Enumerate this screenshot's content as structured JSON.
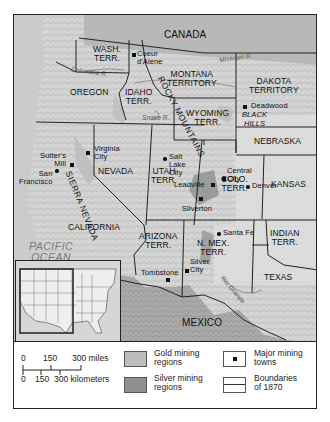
{
  "map": {
    "regions": {
      "canada": "CANADA",
      "wash": "WASH.\nTERR.",
      "oregon": "OREGON",
      "idaho": "IDAHO\nTERR.",
      "montana": "MONTANA\nTERRITORY",
      "dakota": "DAKOTA\nTERRITORY",
      "wyoming": "WYOMING\nTERR.",
      "nebraska": "NEBRASKA",
      "nevada": "NEVADA",
      "utah": "UTAH\nTERR.",
      "colorado": "COLO.\nTERR.",
      "kansas": "KANSAS",
      "california": "CALIFORNIA",
      "arizona": "ARIZONA\nTERR.",
      "new_mexico": "N. MEX.\nTERR.",
      "indian": "INDIAN\nTERR.",
      "texas": "TEXAS",
      "mexico": "MEXICO",
      "pacific": "PACIFIC\nOCEAN"
    },
    "features": {
      "sierra_nevada": "SIERRA NEVADA",
      "rocky_mountains": "ROCKY MOUNTAINS",
      "black_hills": "BLACK\nHILLS",
      "missouri_river": "Missouri R.",
      "columbia_river": "Columbia R.",
      "snake_river": "Snake R.",
      "rio_grande": "Rio Grande"
    },
    "towns": [
      {
        "name": "Coeur\nd'Alene",
        "type": "mining"
      },
      {
        "name": "Deadwood",
        "type": "mining"
      },
      {
        "name": "Virginia\nCity",
        "type": "mining"
      },
      {
        "name": "Sutter's\nMill",
        "type": "mining"
      },
      {
        "name": "San\nFrancisco",
        "type": "city"
      },
      {
        "name": "Salt\nLake\nCity",
        "type": "city"
      },
      {
        "name": "Central\nCity",
        "type": "mining"
      },
      {
        "name": "Leadville",
        "type": "mining"
      },
      {
        "name": "Denver",
        "type": "city"
      },
      {
        "name": "Silverton",
        "type": "mining"
      },
      {
        "name": "Santa Fe",
        "type": "city"
      },
      {
        "name": "Silver\nCity",
        "type": "mining"
      },
      {
        "name": "Tombstone",
        "type": "mining"
      }
    ]
  },
  "legend": {
    "scale_miles": [
      "0",
      "150",
      "300 miles"
    ],
    "scale_km": [
      "0",
      "150",
      "300 kilometers"
    ],
    "gold": "Gold mining\nregions",
    "silver": "Silver mining\nregions",
    "towns": "Major mining\ntowns",
    "boundaries": "Boundaries\nof 1870",
    "colors": {
      "gold": "#bdbdbd",
      "silver": "#8f8f8f"
    }
  }
}
